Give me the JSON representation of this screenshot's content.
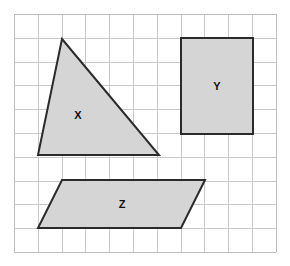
{
  "figure": {
    "canvas": {
      "width": 290,
      "height": 266,
      "background": "#ffffff"
    },
    "grid": {
      "name": "square-grid",
      "origin_x": 14,
      "origin_y": 14,
      "cell_size": 23.8,
      "columns": 11,
      "rows": 10,
      "line_color": "#c9c9c9",
      "border_color": "#bdbdbd",
      "line_width": 1
    },
    "style": {
      "shape_fill": "#d5d5d5",
      "shape_stroke": "#2b2b2b",
      "shape_stroke_width": 2,
      "label_color": "#111111"
    },
    "shapes": [
      {
        "id": "shape-x",
        "label": "X",
        "type": "triangle",
        "points": "62,39 159,155 38,155",
        "label_x": 78,
        "label_y": 116
      },
      {
        "id": "shape-y",
        "label": "Y",
        "type": "rectangle",
        "points": "181,38 253,38 253,134 181,134",
        "label_x": 217,
        "label_y": 87
      },
      {
        "id": "shape-z",
        "label": "Z",
        "type": "parallelogram",
        "points": "62,180 205,180 181,228 38,228",
        "label_x": 122,
        "label_y": 205
      }
    ]
  }
}
